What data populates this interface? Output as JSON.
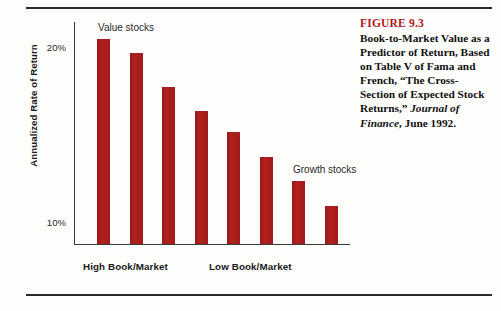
{
  "figure": {
    "number_label": "FIGURE 9.3",
    "caption_line1": "Book-to-Market Value as a",
    "caption_line2": "Predictor of Return, Based",
    "caption_line3": "on Table V of Fama and",
    "caption_line4": "French, “The Cross-",
    "caption_line5": "Section of Expected Stock",
    "caption_line6_plain": "Returns,” ",
    "caption_line6_italic": "Journal of",
    "caption_line7_italic": "Finance",
    "caption_line7_plain": ", June 1992.",
    "accent_color": "#b0181d"
  },
  "chart_data": {
    "type": "bar",
    "title": "Book-to-Market Value as a Predictor of Return",
    "xlabel": "",
    "ylabel": "Annualized Rate of Return",
    "categories": [
      "1",
      "2",
      "3",
      "4",
      "5",
      "6",
      "7",
      "8"
    ],
    "values": [
      20.5,
      19.7,
      17.8,
      16.4,
      15.2,
      13.8,
      12.4,
      11.0
    ],
    "ylim": [
      8.8,
      21.5
    ],
    "yticks": [
      10,
      20
    ],
    "ytick_labels": [
      "10%",
      "20%"
    ],
    "grid": false,
    "legend": false,
    "bar_color": "#a81c1c",
    "annotations": [
      {
        "text": "Value stocks",
        "x_index": 0,
        "value": 20.5
      },
      {
        "text": "Growth stocks",
        "x_index": 6,
        "value": 12.4
      }
    ],
    "axis_group_labels": [
      "High Book/Market",
      "Low Book/Market"
    ]
  },
  "axis": {
    "y_title": "Annualized Rate of Return",
    "tick_high": "20%",
    "tick_low": "10%"
  },
  "annotations": {
    "value_stocks": "Value stocks",
    "growth_stocks": "Growth stocks"
  },
  "x_axis": {
    "high_label": "High Book/Market",
    "low_label": "Low Book/Market"
  }
}
